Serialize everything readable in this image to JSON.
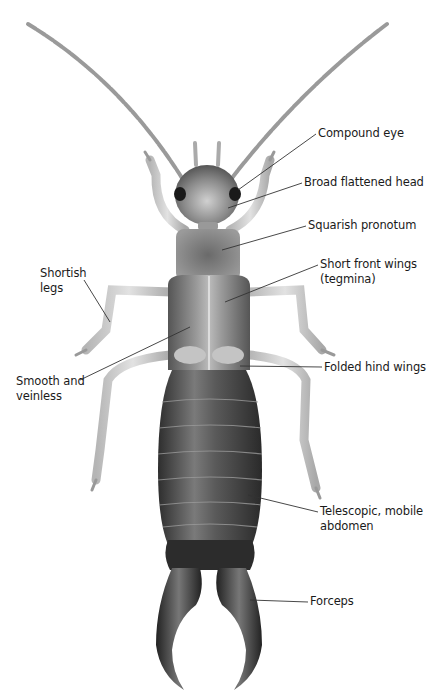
{
  "figure": {
    "labels": [
      {
        "id": "compound-eye",
        "text": "Compound eye",
        "x": 318,
        "y": 127
      },
      {
        "id": "broad-flattened-head",
        "text": "Broad flattened head",
        "x": 304,
        "y": 176
      },
      {
        "id": "squarish-pronotum",
        "text": "Squarish pronotum",
        "x": 308,
        "y": 219
      },
      {
        "id": "short-front-wings",
        "text": "Short front wings\n(tegmina)",
        "x": 320,
        "y": 258
      },
      {
        "id": "shortish-legs",
        "text": "Shortish\nlegs",
        "x": 40,
        "y": 267
      },
      {
        "id": "smooth-and-veinless",
        "text": "Smooth and\nveinless",
        "x": 16,
        "y": 375
      },
      {
        "id": "folded-hind-wings",
        "text": "Folded hind wings",
        "x": 324,
        "y": 360
      },
      {
        "id": "telescopic-mobile-abdomen",
        "text": "Telescopic, mobile\nabdomen",
        "x": 320,
        "y": 505
      },
      {
        "id": "forceps",
        "text": "Forceps",
        "x": 310,
        "y": 595
      }
    ],
    "colors": {
      "background": "#ffffff",
      "leader_line": "#333333",
      "label_text": "#1a1a1a",
      "body_dark": "#3a3a3a",
      "body_mid": "#6e6e6e",
      "limb_light": "#c8c8c8"
    }
  }
}
